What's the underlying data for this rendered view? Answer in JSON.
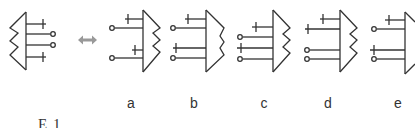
{
  "diagram": {
    "stroke_color": "#333333",
    "arrow_color": "#999999",
    "original": {
      "name": "reference-molecule",
      "lines_top_to_bottom": [
        "cross",
        "circle",
        "circle",
        "cross"
      ]
    },
    "relation": "double-arrow",
    "options": [
      {
        "label": "a",
        "orientation": "mirrored",
        "lines_top_to_bottom": [
          "cross",
          "circle",
          "cross",
          "circle"
        ],
        "edge": "zigzag"
      },
      {
        "label": "b",
        "orientation": "mirrored",
        "lines_top_to_bottom": [
          "cross",
          "circle",
          "cross",
          "circle"
        ],
        "edge": "wave"
      },
      {
        "label": "c",
        "orientation": "mirrored",
        "lines_top_to_bottom": [
          "cross",
          "circle",
          "cross",
          "circle"
        ],
        "edge": "zigzag"
      },
      {
        "label": "d",
        "orientation": "mirrored",
        "lines_top_to_bottom": [
          "cross",
          "cross",
          "circle",
          "circle"
        ],
        "edge": "zigzag"
      },
      {
        "label": "e",
        "orientation": "mirrored",
        "lines_top_to_bottom": [
          "cross",
          "circle",
          "cross",
          "circle"
        ],
        "edge": "cut-off"
      }
    ],
    "caption_partial": "E  1"
  }
}
